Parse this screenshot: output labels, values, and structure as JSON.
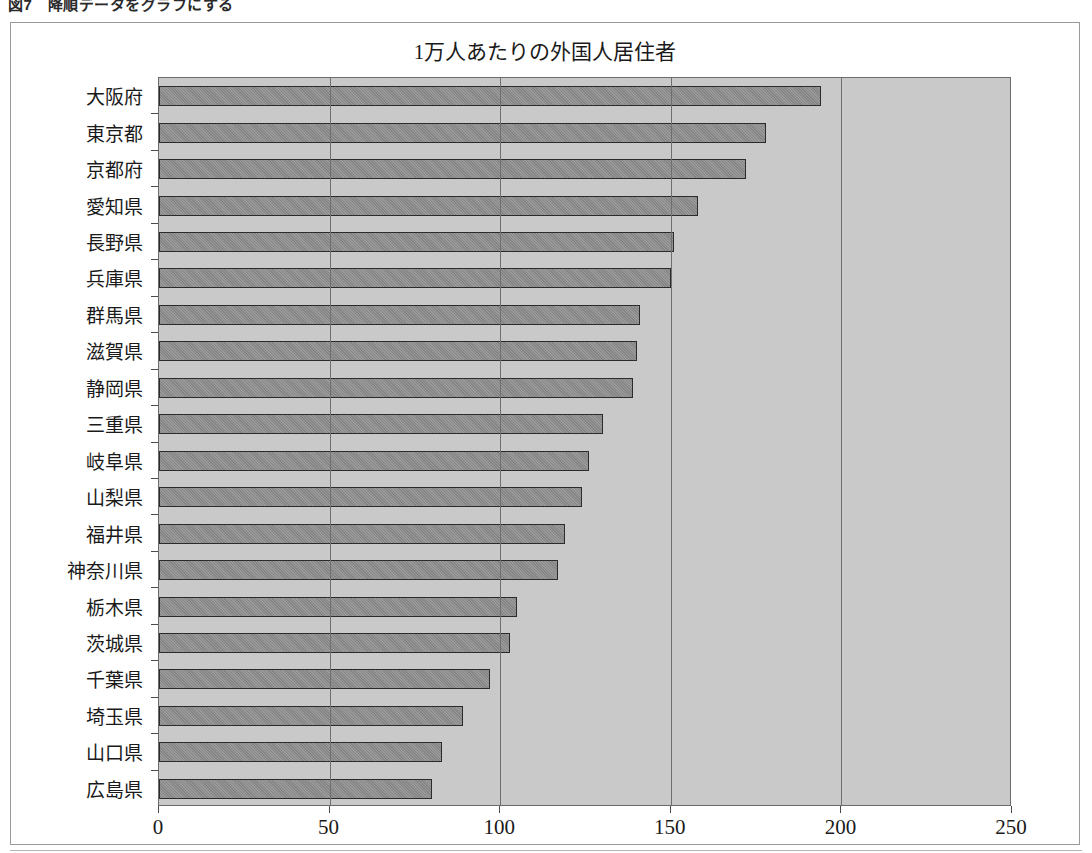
{
  "page": {
    "caption": "図7　降順データをグラフにする"
  },
  "chart_data": {
    "type": "bar",
    "orientation": "horizontal",
    "title": "1万人あたりの外国人居住者",
    "xlabel": "",
    "ylabel": "",
    "xlim": [
      0,
      250
    ],
    "xticks": [
      0,
      50,
      100,
      150,
      200,
      250
    ],
    "xtick_labels": [
      "0",
      "50",
      "100",
      "150",
      "200",
      "250"
    ],
    "grid": true,
    "legend": "none",
    "sorted": "descending",
    "colors": {
      "plot_background": "#c9c9c9",
      "bar_fill": "#8c8c8c",
      "bar_edge": "#2b2b2b",
      "grid": "#6f6f6f",
      "frame": "#9a9a9a",
      "text": "#1a1a1a"
    },
    "categories": [
      "大阪府",
      "東京都",
      "京都府",
      "愛知県",
      "長野県",
      "兵庫県",
      "群馬県",
      "滋賀県",
      "静岡県",
      "三重県",
      "岐阜県",
      "山梨県",
      "福井県",
      "神奈川県",
      "栃木県",
      "茨城県",
      "千葉県",
      "埼玉県",
      "山口県",
      "広島県"
    ],
    "values": [
      194,
      178,
      172,
      158,
      151,
      150,
      141,
      140,
      139,
      130,
      126,
      124,
      119,
      117,
      105,
      103,
      97,
      89,
      83,
      80
    ]
  }
}
